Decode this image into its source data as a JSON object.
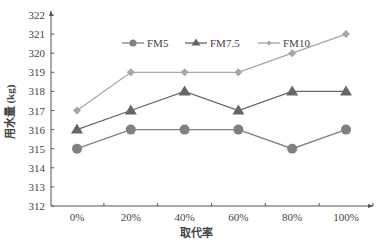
{
  "chart_data": {
    "type": "line",
    "title": "",
    "xlabel": "取代率",
    "ylabel": "用水量 (kg)",
    "categories": [
      "0%",
      "20%",
      "40%",
      "60%",
      "80%",
      "100%"
    ],
    "y_ticks": [
      312,
      313,
      314,
      315,
      316,
      317,
      318,
      319,
      320,
      321,
      322
    ],
    "ylim": [
      312,
      322
    ],
    "grid": false,
    "legend_position": "top",
    "series": [
      {
        "name": "FM5",
        "marker": "circle",
        "color": "#808080",
        "values": [
          315,
          316,
          316,
          316,
          315,
          316
        ]
      },
      {
        "name": "FM7.5",
        "marker": "triangle",
        "color": "#666666",
        "values": [
          316,
          317,
          318,
          317,
          318,
          318
        ]
      },
      {
        "name": "FM10",
        "marker": "diamond",
        "color": "#a6a6a6",
        "values": [
          317,
          319,
          319,
          319,
          320,
          321
        ]
      }
    ]
  }
}
